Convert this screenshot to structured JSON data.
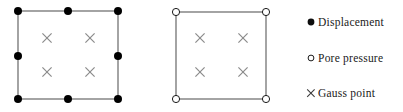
{
  "figure": {
    "type": "element-node-diagram",
    "background_color": "#ffffff",
    "line_color": "#5a5a5a",
    "node_fill_color": "#000000",
    "node_hollow_fill": "#ffffff",
    "gauss_color": "#8a8a8a"
  },
  "elements": [
    {
      "id": "displacement-element",
      "name": "Displacement element (8-node)",
      "square": {
        "x": 18,
        "y": 11,
        "width": 100,
        "height": 88
      },
      "node_style": "filled",
      "node_radius": 4,
      "nodes": [
        {
          "label": "corner-top-left",
          "x": 18,
          "y": 11
        },
        {
          "label": "edge-top-mid",
          "x": 68,
          "y": 11
        },
        {
          "label": "corner-top-right",
          "x": 118,
          "y": 11
        },
        {
          "label": "edge-left-mid",
          "x": 18,
          "y": 56
        },
        {
          "label": "edge-right-mid",
          "x": 118,
          "y": 56
        },
        {
          "label": "corner-bottom-left",
          "x": 18,
          "y": 99
        },
        {
          "label": "edge-bottom-mid",
          "x": 68,
          "y": 99
        },
        {
          "label": "corner-bottom-right",
          "x": 118,
          "y": 99
        }
      ],
      "gauss_points": [
        {
          "label": "gauss-1",
          "x": 47,
          "y": 38
        },
        {
          "label": "gauss-2",
          "x": 90,
          "y": 38
        },
        {
          "label": "gauss-3",
          "x": 47,
          "y": 72
        },
        {
          "label": "gauss-4",
          "x": 90,
          "y": 72
        }
      ]
    },
    {
      "id": "pore-pressure-element",
      "name": "Pore pressure element (4-node)",
      "square": {
        "x": 176,
        "y": 12,
        "width": 90,
        "height": 87
      },
      "node_style": "hollow",
      "node_radius": 3.6,
      "nodes": [
        {
          "label": "corner-top-left",
          "x": 176,
          "y": 12
        },
        {
          "label": "corner-top-right",
          "x": 266,
          "y": 12
        },
        {
          "label": "corner-bottom-left",
          "x": 176,
          "y": 99
        },
        {
          "label": "corner-bottom-right",
          "x": 266,
          "y": 99
        }
      ],
      "gauss_points": [
        {
          "label": "gauss-1",
          "x": 200,
          "y": 38
        },
        {
          "label": "gauss-2",
          "x": 243,
          "y": 38
        },
        {
          "label": "gauss-3",
          "x": 200,
          "y": 72
        },
        {
          "label": "gauss-4",
          "x": 243,
          "y": 72
        }
      ]
    }
  ],
  "legend": {
    "items": [
      {
        "marker": "filled-circle-icon",
        "label": "Displacement"
      },
      {
        "marker": "hollow-circle-icon",
        "label": "Pore pressure"
      },
      {
        "marker": "cross-x-icon",
        "label": "Gauss point"
      }
    ]
  }
}
